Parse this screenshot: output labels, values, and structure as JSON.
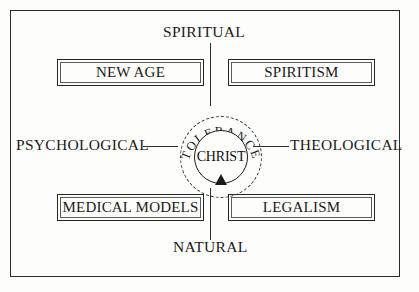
{
  "diagram": {
    "center": {
      "inner_label": "CHRIST",
      "ring_label": "TOLERANCE",
      "ring_style": "dashed",
      "arrow": "arrow-up-into-circle"
    },
    "poles": {
      "top": "SPIRITUAL",
      "bottom": "NATURAL",
      "left": "PSYCHOLOGICAL",
      "right": "THEOLOGICAL"
    },
    "quadrants": [
      {
        "position": "top-left",
        "label": "NEW AGE"
      },
      {
        "position": "top-right",
        "label": "SPIRITISM"
      },
      {
        "position": "bottom-left",
        "label": "MEDICAL MODELS"
      },
      {
        "position": "bottom-right",
        "label": "LEGALISM"
      }
    ],
    "colors": {
      "ink": "#1a1a1a",
      "line": "#2f2f2f",
      "frame": "#2b2b2b",
      "paper": "#fdfdfb"
    }
  }
}
